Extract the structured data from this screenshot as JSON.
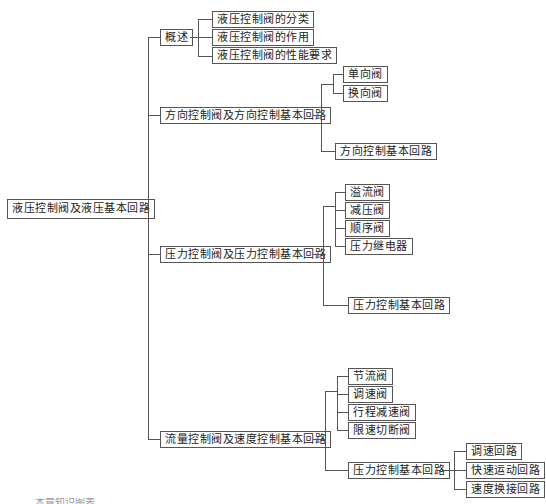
{
  "root": {
    "label": "液压控制阀及液压基本回路"
  },
  "branches": [
    {
      "label": "概述",
      "children": [
        "液压控制阀的分类",
        "液压控制阀的作用",
        "液压控制阀的性能要求"
      ]
    },
    {
      "label": "方向控制阀及方向控制基本回路",
      "children": [
        "单向阀",
        "换向阀",
        "方向控制基本回路"
      ]
    },
    {
      "label": "压力控制阀及压力控制基本回路",
      "children": [
        "溢流阀",
        "减压阀",
        "顺序阀",
        "压力继电器",
        "压力控制基本回路"
      ]
    },
    {
      "label": "流量控制阀及速度控制基本回路",
      "children": [
        "节流阀",
        "调速阀",
        "行程减速阀",
        "限速切断阀",
        "压力控制基本回路"
      ],
      "grandchildren": [
        "调速回路",
        "快速运动回路",
        "速度换接回路"
      ]
    }
  ],
  "footer": {
    "text": "本章知识图表"
  }
}
